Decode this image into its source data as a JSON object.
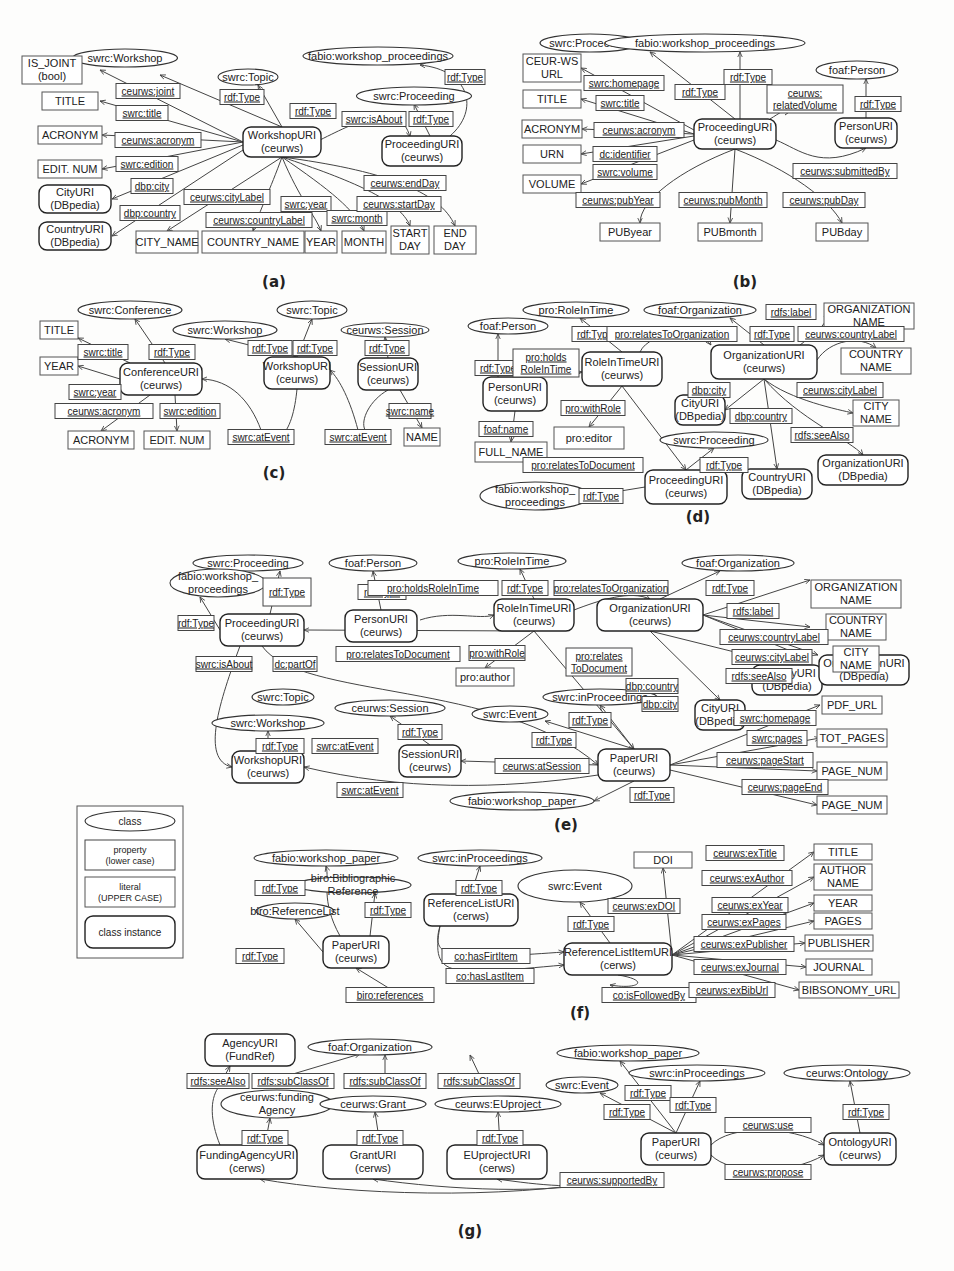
{
  "colors": {
    "background": "#fdfdfc",
    "stroke": "#333333",
    "text": "#222222"
  },
  "legend": {
    "class": "class",
    "property": [
      "property",
      "(lower case)"
    ],
    "literal": [
      "literal",
      "(UPPER CASE)"
    ],
    "instance": "class instance"
  },
  "diagrams": [
    {
      "caption": "(a)",
      "classes": [
        "swrc:Workshop",
        "swrc:Topic",
        "fabio:workshop_proceedings",
        "swrc:Proceeding"
      ],
      "instances": [
        [
          "WorkshopURI",
          "(ceurws)"
        ],
        [
          "ProceedingURI",
          "(ceurws)"
        ],
        [
          "CityURI",
          "(DBpedia)"
        ],
        [
          "CountryURI",
          "(DBpedia)"
        ]
      ],
      "literals": [
        [
          "IS_JOINT",
          "(bool)"
        ],
        [
          "TITLE"
        ],
        [
          "ACRONYM"
        ],
        [
          "EDIT. NUM"
        ],
        [
          "CITY_NAME"
        ],
        [
          "COUNTRY_NAME"
        ],
        [
          "YEAR"
        ],
        [
          "MONTH"
        ],
        [
          "START",
          "DAY"
        ],
        [
          "END",
          "DAY"
        ]
      ],
      "properties": [
        "ceurws:joint",
        "swrc:title",
        "ceurws:acronym",
        "swrc:edition",
        "dbp:city",
        "dbp:country",
        "rdf:Type",
        "rdf:Type",
        "swrc:isAbout",
        "rdf:Type",
        "rdf:Type",
        "ceurws:cityLabel",
        "ceurws:countryLabel",
        "swrc:year",
        "swrc:month",
        "ceurws:startDay",
        "ceurws:endDay"
      ]
    },
    {
      "caption": "(b)",
      "classes": [
        "swrc:Proceeding",
        "fabio:workshop_proceedings",
        "foaf:Person"
      ],
      "instances": [
        [
          "ProceedingURI",
          "(ceurws)"
        ],
        [
          "PersonURI",
          "(ceurws)"
        ]
      ],
      "literals": [
        [
          "CEUR-WS",
          "URL"
        ],
        [
          "TITLE"
        ],
        [
          "ACRONYM"
        ],
        [
          "URN"
        ],
        [
          "VOLUME"
        ],
        [
          "PUByear"
        ],
        [
          "PUBmonth"
        ],
        [
          "PUBday"
        ]
      ],
      "properties": [
        "swrc:homepage",
        "swrc:title",
        "ceurws:acronym",
        "dc:identifier",
        "swrc:volume",
        "rdf:Type",
        "rdf:Type",
        [
          "ceurws:",
          "relatedVolume"
        ],
        "rdf:Type",
        "ceurws:submittedBy",
        "ceurws:pubYear",
        "ceurws:pubMonth",
        "ceurws:pubDay"
      ]
    },
    {
      "caption": "(c)",
      "classes": [
        "swrc:Conference",
        "swrc:Workshop",
        "swrc:Topic",
        "ceurws:Session"
      ],
      "instances": [
        [
          "ConferenceURI",
          "(ceurws)"
        ],
        [
          "WorkshopURI",
          "(ceurws)"
        ],
        [
          "SessionURI",
          "(ceurws)"
        ]
      ],
      "literals": [
        [
          "TITLE"
        ],
        [
          "YEAR"
        ],
        [
          "ACRONYM"
        ],
        [
          "EDIT. NUM"
        ],
        [
          "NAME"
        ]
      ],
      "properties": [
        "swrc:title",
        "rdf:Type",
        "swrc:year",
        "ceurws:acronym",
        "swrc:edition",
        "rdf:Type",
        "rdf:Type",
        "rdf:Type",
        "swrc:name",
        "swrc:atEvent",
        "swrc:atEvent"
      ]
    },
    {
      "caption": "(d)",
      "classes": [
        "foaf:Person",
        "pro:RoleInTime",
        "foaf:Organization",
        "swrc:Proceeding",
        [
          "fabio:workshop_",
          "proceedings"
        ]
      ],
      "instances": [
        [
          "PersonURI",
          "(ceurws)"
        ],
        [
          "RoleInTimeURI",
          "(ceurws)"
        ],
        [
          "OrganizationURI",
          "(ceurws)"
        ],
        [
          "CityURI",
          "(DBpedia)"
        ],
        [
          "ProceedingURI",
          "(ceurws)"
        ],
        [
          "CountryURI",
          "(DBpedia)"
        ],
        [
          "OrganizationURI",
          "(DBpedia)"
        ]
      ],
      "literals": [
        [
          "FULL_NAME"
        ],
        [
          "pro:editor"
        ],
        [
          "ORGANIZATION",
          "NAME"
        ],
        [
          "COUNTRY",
          "NAME"
        ],
        [
          "CITY",
          "NAME"
        ]
      ],
      "properties": [
        "rdf:Type",
        [
          "pro:holds",
          "RoleInTime"
        ],
        "rdf:Type",
        "pro:relatesToOrganization",
        "rdf:Type",
        "rdfs:label",
        "ceurws:countryLabel",
        "ceurws:cityLabel",
        "dbp:city",
        "dbp:country",
        "rdfs:seeAlso",
        "foaf:name",
        "pro:withRole",
        "pro:relatesToDocument",
        "rdf:Type",
        "rdf:Type"
      ]
    },
    {
      "caption": "(e)",
      "classes": [
        "swrc:Proceeding",
        [
          "fabio:workshop_",
          "proceedings"
        ],
        "foaf:Person",
        "pro:RoleInTime",
        "foaf:Organization",
        "swrc:Topic",
        "swrc:Workshop",
        "ceurws:Session",
        "swrc:Event",
        "swrc:inProceedings",
        "fabio:workshop_paper"
      ],
      "instances": [
        [
          "ProceedingURI",
          "(ceurws)"
        ],
        [
          "PersonURI",
          "(ceurws)"
        ],
        [
          "RoleInTimeURI",
          "(ceurws)"
        ],
        [
          "OrganizationURI",
          "(ceurws)"
        ],
        [
          "CountryURI",
          "(DBpedia)"
        ],
        [
          "CityURI",
          "(DBpedia)"
        ],
        [
          "OrganizationURI",
          "(DBpedia)"
        ],
        [
          "WorkshopURI",
          "(ceurws)"
        ],
        [
          "SessionURI",
          "(ceurws)"
        ],
        [
          "PaperURI",
          "(ceurws)"
        ]
      ],
      "literals": [
        [
          "ORGANIZATION",
          "NAME"
        ],
        [
          "COUNTRY",
          "NAME"
        ],
        [
          "CITY",
          "NAME"
        ],
        [
          "pro:author"
        ],
        [
          "PDF_URL"
        ],
        [
          "TOT_PAGES"
        ],
        [
          "PAGE_NUM"
        ],
        [
          "PAGE_NUM"
        ]
      ],
      "properties": [
        "rdf:Type",
        "rdf:Type",
        "rdf:Type",
        "pro:holdsRoleInTime",
        "rdf:Type",
        "pro:relatesToOrganization",
        "rdf:Type",
        "rdfs:label",
        "ceurws:countryLabel",
        "ceurws:cityLabel",
        "rdfs:seeAlso",
        "pro:relatesToDocument",
        "pro:withRole",
        [
          "pro:relates",
          "ToDocument"
        ],
        "dbp:country",
        "dbp:city",
        "swrc:isAbout",
        "dc:partOf",
        "rdf:Type",
        "rdf:Type",
        "swrc:atEvent",
        "rdf:Type",
        "rdf:Type",
        "swrc:homepage",
        "swrc:pages",
        "ceurws:atSession",
        "ceurws:pageStart",
        "swrc:atEvent",
        "ceurws:pageEnd",
        "rdf:Type"
      ]
    },
    {
      "caption": "(f)",
      "classes": [
        "fabio:workshop_paper",
        "swrc:inProceedings",
        "swrc:Event",
        "biro:ReferenceList",
        [
          "biro:Bibliographic",
          "Reference"
        ]
      ],
      "instances": [
        [
          "PaperURI",
          "(ceurws)"
        ],
        [
          "ReferenceListURI",
          "(cerws)"
        ],
        [
          "ReferenceListItemURI",
          "(cerws)"
        ]
      ],
      "literals": [
        [
          "DOI"
        ],
        [
          "TITLE"
        ],
        [
          "AUTHOR",
          "NAME"
        ],
        [
          "YEAR"
        ],
        [
          "PAGES"
        ],
        [
          "PUBLISHER"
        ],
        [
          "JOURNAL"
        ],
        [
          "BIBSONOMY_URL"
        ]
      ],
      "properties": [
        "rdf:Type",
        "rdf:Type",
        "rdf:Type",
        "rdf:Type",
        "rdf:Type",
        "co:hasFirtItem",
        "co:hasLastItem",
        "biro:references",
        "co:isFollowedBy",
        "ceurws:exDOI",
        "ceurws:exTitle",
        "ceurws:exAuthor",
        "ceurws:exYear",
        "ceurws:exPages",
        "ceurws:exPublisher",
        "ceurws:exJournal",
        "ceurws:exBibUrl"
      ]
    },
    {
      "caption": "(g)",
      "classes": [
        "foaf:Organization",
        [
          "ceurws:funding",
          "Agency"
        ],
        "ceurws:Grant",
        "ceurws:EUproject",
        "fabio:workshop_paper",
        "swrc:Event",
        "swrc:inProceedings",
        "ceurws:Ontology"
      ],
      "instances": [
        [
          "AgencyURI",
          "(FundRef)"
        ],
        [
          "FundingAgencyURI",
          "(cerws)"
        ],
        [
          "GrantURI",
          "(cerws)"
        ],
        [
          "EUprojectURI",
          "(cerws)"
        ],
        [
          "PaperURI",
          "(ceurws)"
        ],
        [
          "OntologyURI",
          "(ceurws)"
        ]
      ],
      "literals": [],
      "properties": [
        "rdfs:seeAlso",
        "rdfs:subClassOf",
        "rdfs:subClassOf",
        "rdfs:subClassOf",
        "rdf:Type",
        "rdf:Type",
        "rdf:Type",
        "rdf:Type",
        "rdf:Type",
        "rdf:Type",
        "rdf:Type",
        "ceurws:use",
        "ceurws:propose",
        "ceurws:supportedBy"
      ]
    }
  ]
}
